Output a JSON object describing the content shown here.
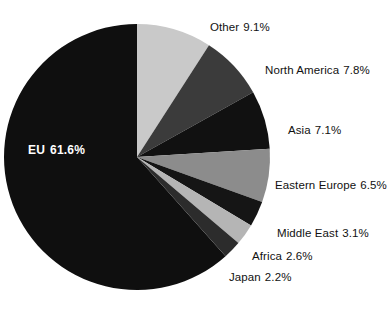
{
  "chart_data": {
    "type": "pie",
    "title": "",
    "subtitle": "",
    "xlabel": "",
    "ylabel": "",
    "legend_position": "callout-labels-right",
    "grid": false,
    "start_angle_deg": 0,
    "direction": "clockwise",
    "units": "percent",
    "categories": [
      "Other",
      "North America",
      "Asia",
      "Eastern Europe",
      "Middle East",
      "Africa",
      "Japan",
      "EU"
    ],
    "values": [
      9.1,
      7.8,
      7.1,
      6.5,
      3.1,
      2.6,
      2.2,
      61.6
    ],
    "slices": [
      {
        "label": "Other",
        "value": 9.1,
        "value_text": "9.1%",
        "color": "#c9c9c9"
      },
      {
        "label": "North America",
        "value": 7.8,
        "value_text": "7.8%",
        "color": "#3b3b3b"
      },
      {
        "label": "Asia",
        "value": 7.1,
        "value_text": "7.1%",
        "color": "#111111"
      },
      {
        "label": "Eastern Europe",
        "value": 6.5,
        "value_text": "6.5%",
        "color": "#8c8c8c"
      },
      {
        "label": "Middle East",
        "value": 3.1,
        "value_text": "3.1%",
        "color": "#151515"
      },
      {
        "label": "Africa",
        "value": 2.6,
        "value_text": "2.6%",
        "color": "#b5b5b5"
      },
      {
        "label": "Japan",
        "value": 2.2,
        "value_text": "2.2%",
        "color": "#2c2c2c"
      },
      {
        "label": "EU",
        "value": 61.6,
        "value_text": "61.6%",
        "color": "#0f0f0f"
      }
    ]
  },
  "labels": {
    "other": {
      "name": "Other",
      "value_text": "9.1%"
    },
    "north_america": {
      "name": "North America",
      "value_text": "7.8%"
    },
    "asia": {
      "name": "Asia",
      "value_text": "7.1%"
    },
    "eastern_europe": {
      "name": "Eastern Europe",
      "value_text": "6.5%"
    },
    "middle_east": {
      "name": "Middle East",
      "value_text": "3.1%"
    },
    "africa": {
      "name": "Africa",
      "value_text": "2.6%"
    },
    "japan": {
      "name": "Japan",
      "value_text": "2.2%"
    },
    "eu": {
      "name": "EU",
      "value_text": "61.6%"
    }
  },
  "colors": {
    "background": "#ffffff",
    "text": "#111111",
    "inner_text": "#ffffff",
    "light_gray": "#c9c9c9",
    "medium_gray": "#8c8c8c",
    "dark_gray": "#3b3b3b",
    "near_black": "#111111"
  }
}
